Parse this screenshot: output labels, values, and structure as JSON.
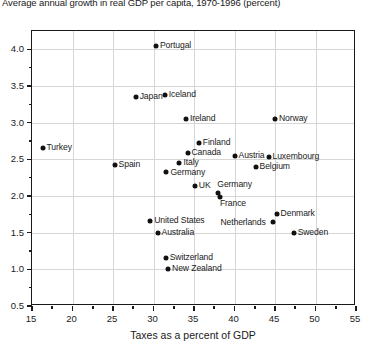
{
  "chart_data": {
    "type": "scatter",
    "title": "Average annual growth in real GDP per capita, 1970-1996 (percent)",
    "xlabel": "Taxes as a percent of GDP",
    "ylabel": "",
    "xlim": [
      15,
      55
    ],
    "ylim": [
      0.5,
      4.25
    ],
    "xticks": [
      15,
      20,
      25,
      30,
      35,
      40,
      45,
      50,
      55
    ],
    "yticks": [
      0.5,
      1.0,
      1.5,
      2.0,
      2.5,
      3.0,
      3.5,
      4.0
    ],
    "xtick_labels": [
      "15",
      "20",
      "25",
      "30",
      "35",
      "40",
      "45",
      "50",
      "55"
    ],
    "ytick_labels": [
      "0.5",
      "1.0",
      "1.5",
      "2.0",
      "2.5",
      "3.0",
      "3.5",
      "4.0"
    ],
    "grid": true,
    "legend": false,
    "points": [
      {
        "label": "Portugal",
        "x": 30.3,
        "y": 4.05
      },
      {
        "label": "Japan",
        "x": 27.8,
        "y": 3.35
      },
      {
        "label": "Iceland",
        "x": 31.4,
        "y": 3.38
      },
      {
        "label": "Ireland",
        "x": 34.0,
        "y": 3.05
      },
      {
        "label": "Norway",
        "x": 45.0,
        "y": 3.05
      },
      {
        "label": "Turkey",
        "x": 16.3,
        "y": 2.65
      },
      {
        "label": "Finland",
        "x": 35.6,
        "y": 2.72
      },
      {
        "label": "Canada",
        "x": 34.2,
        "y": 2.58
      },
      {
        "label": "Austria",
        "x": 40.0,
        "y": 2.55
      },
      {
        "label": "Luxembourg",
        "x": 44.2,
        "y": 2.53
      },
      {
        "label": "Spain",
        "x": 25.2,
        "y": 2.42
      },
      {
        "label": "Italy",
        "x": 33.2,
        "y": 2.45
      },
      {
        "label": "Belgium",
        "x": 42.6,
        "y": 2.4
      },
      {
        "label": "Germany",
        "x": 31.6,
        "y": 2.33
      },
      {
        "label": "UK",
        "x": 35.1,
        "y": 2.13
      },
      {
        "label": "Germany",
        "x": 38.0,
        "y": 2.04
      },
      {
        "label": "France",
        "x": 38.2,
        "y": 1.99
      },
      {
        "label": "Denmark",
        "x": 45.2,
        "y": 1.75
      },
      {
        "label": "United States",
        "x": 29.6,
        "y": 1.66
      },
      {
        "label": "Netherlands",
        "x": 44.8,
        "y": 1.64
      },
      {
        "label": "Australia",
        "x": 30.5,
        "y": 1.5
      },
      {
        "label": "Sweden",
        "x": 47.3,
        "y": 1.5
      },
      {
        "label": "Switzerland",
        "x": 31.5,
        "y": 1.15
      },
      {
        "label": "New Zealand",
        "x": 31.8,
        "y": 1.0
      }
    ]
  }
}
